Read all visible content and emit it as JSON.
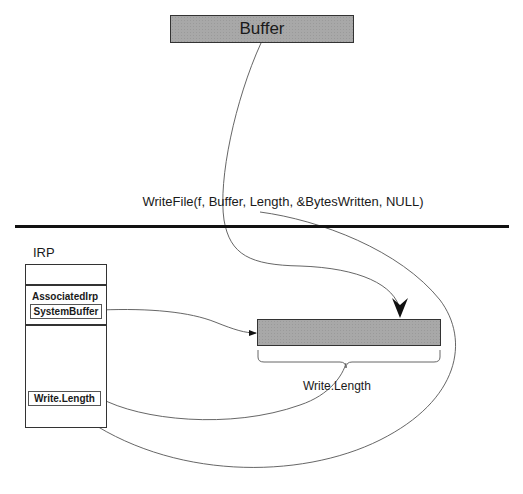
{
  "diagram": {
    "user_buffer": {
      "label": "Buffer",
      "fill": "#a8a8a8"
    },
    "api_call": "WriteFile(f, Buffer, Length,  &BytesWritten, NULL)",
    "irp": {
      "title": "IRP",
      "fields": {
        "associated_irp": "AssociatedIrp",
        "system_buffer": "SystemBuffer",
        "write_length": "Write.Length"
      }
    },
    "system_buffer_region": {
      "fill": "#a8a8a8"
    },
    "brace_label": "Write.Length",
    "edges": [
      {
        "from": "user_buffer",
        "to": "system_buffer_region",
        "meaning": "data copied"
      },
      {
        "from": "irp.system_buffer",
        "to": "system_buffer_region",
        "meaning": "points to"
      },
      {
        "from": "irp.write_length",
        "to": "brace_label",
        "meaning": "size"
      },
      {
        "from": "api_call.Length",
        "to": "irp.write_length",
        "meaning": "length copied"
      }
    ]
  }
}
